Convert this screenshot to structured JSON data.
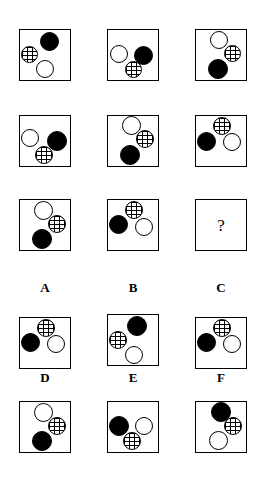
{
  "puzzle": {
    "title": "Visual analogy matrix puzzle",
    "question_mark": "?",
    "circle_kinds": {
      "black": "solid-black-circle",
      "white": "outlined-white-circle",
      "hatch": "cross-hatched-circle"
    },
    "matrix": {
      "rows": 3,
      "cols": 3,
      "cells": [
        {
          "id": "matrix-cell-1-1",
          "box": {
            "x": 19,
            "y": 29,
            "w": 52,
            "h": 52
          },
          "circles": [
            {
              "kind": "black",
              "x": 20,
              "y": 2,
              "d": 19
            },
            {
              "kind": "hatch",
              "x": 1,
              "y": 16,
              "d": 17
            },
            {
              "kind": "white",
              "x": 16,
              "y": 30,
              "d": 18
            }
          ]
        },
        {
          "id": "matrix-cell-1-2",
          "box": {
            "x": 107,
            "y": 29,
            "w": 52,
            "h": 52
          },
          "circles": [
            {
              "kind": "white",
              "x": 2,
              "y": 15,
              "d": 18
            },
            {
              "kind": "black",
              "x": 26,
              "y": 16,
              "d": 19
            },
            {
              "kind": "hatch",
              "x": 17,
              "y": 31,
              "d": 17
            }
          ]
        },
        {
          "id": "matrix-cell-1-3",
          "box": {
            "x": 195,
            "y": 29,
            "w": 52,
            "h": 52
          },
          "circles": [
            {
              "kind": "white",
              "x": 14,
              "y": 1,
              "d": 18
            },
            {
              "kind": "hatch",
              "x": 28,
              "y": 15,
              "d": 17
            },
            {
              "kind": "black",
              "x": 12,
              "y": 29,
              "d": 20
            }
          ]
        },
        {
          "id": "matrix-cell-2-1",
          "box": {
            "x": 19,
            "y": 115,
            "w": 52,
            "h": 52
          },
          "circles": [
            {
              "kind": "white",
              "x": 1,
              "y": 13,
              "d": 18
            },
            {
              "kind": "black",
              "x": 27,
              "y": 15,
              "d": 20
            },
            {
              "kind": "hatch",
              "x": 15,
              "y": 30,
              "d": 18
            }
          ]
        },
        {
          "id": "matrix-cell-2-2",
          "box": {
            "x": 107,
            "y": 115,
            "w": 52,
            "h": 52
          },
          "circles": [
            {
              "kind": "white",
              "x": 14,
              "y": 0,
              "d": 19
            },
            {
              "kind": "hatch",
              "x": 28,
              "y": 14,
              "d": 18
            },
            {
              "kind": "black",
              "x": 12,
              "y": 29,
              "d": 20
            }
          ]
        },
        {
          "id": "matrix-cell-2-3",
          "box": {
            "x": 195,
            "y": 115,
            "w": 52,
            "h": 52
          },
          "circles": [
            {
              "kind": "hatch",
              "x": 17,
              "y": 1,
              "d": 18
            },
            {
              "kind": "black",
              "x": 1,
              "y": 16,
              "d": 19
            },
            {
              "kind": "white",
              "x": 27,
              "y": 17,
              "d": 18
            }
          ]
        },
        {
          "id": "matrix-cell-3-1",
          "box": {
            "x": 19,
            "y": 199,
            "w": 52,
            "h": 52
          },
          "circles": [
            {
              "kind": "white",
              "x": 14,
              "y": 1,
              "d": 19
            },
            {
              "kind": "hatch",
              "x": 28,
              "y": 15,
              "d": 18
            },
            {
              "kind": "black",
              "x": 12,
              "y": 29,
              "d": 20
            }
          ]
        },
        {
          "id": "matrix-cell-3-2",
          "box": {
            "x": 107,
            "y": 199,
            "w": 52,
            "h": 52
          },
          "circles": [
            {
              "kind": "hatch",
              "x": 17,
              "y": 1,
              "d": 18
            },
            {
              "kind": "black",
              "x": 1,
              "y": 15,
              "d": 19
            },
            {
              "kind": "white",
              "x": 27,
              "y": 18,
              "d": 18
            }
          ]
        },
        {
          "id": "matrix-cell-3-3",
          "box": {
            "x": 195,
            "y": 199,
            "w": 52,
            "h": 52
          },
          "circles": [],
          "is_question": true
        }
      ]
    },
    "options": [
      {
        "id": "option-a",
        "label": "A",
        "label_pos": {
          "x": 16,
          "y": 281
        },
        "box": {
          "x": 19,
          "y": 317,
          "w": 52,
          "h": 52
        },
        "circles": [
          {
            "kind": "hatch",
            "x": 17,
            "y": 1,
            "d": 18
          },
          {
            "kind": "black",
            "x": 1,
            "y": 15,
            "d": 19
          },
          {
            "kind": "white",
            "x": 27,
            "y": 17,
            "d": 18
          }
        ]
      },
      {
        "id": "option-b",
        "label": "B",
        "label_pos": {
          "x": 104,
          "y": 281
        },
        "box": {
          "x": 107,
          "y": 314,
          "w": 52,
          "h": 52
        },
        "circles": [
          {
            "kind": "black",
            "x": 19,
            "y": 1,
            "d": 20
          },
          {
            "kind": "hatch",
            "x": 1,
            "y": 16,
            "d": 18
          },
          {
            "kind": "white",
            "x": 17,
            "y": 31,
            "d": 18
          }
        ]
      },
      {
        "id": "option-c",
        "label": "C",
        "label_pos": {
          "x": 192,
          "y": 281
        },
        "box": {
          "x": 195,
          "y": 317,
          "w": 52,
          "h": 52
        },
        "circles": [
          {
            "kind": "hatch",
            "x": 17,
            "y": 1,
            "d": 18
          },
          {
            "kind": "black",
            "x": 1,
            "y": 15,
            "d": 19
          },
          {
            "kind": "white",
            "x": 27,
            "y": 17,
            "d": 18
          }
        ]
      },
      {
        "id": "option-d",
        "label": "D",
        "label_pos": {
          "x": 16,
          "y": 371
        },
        "box": {
          "x": 19,
          "y": 401,
          "w": 52,
          "h": 52
        },
        "circles": [
          {
            "kind": "white",
            "x": 14,
            "y": 1,
            "d": 19
          },
          {
            "kind": "hatch",
            "x": 28,
            "y": 15,
            "d": 18
          },
          {
            "kind": "black",
            "x": 12,
            "y": 29,
            "d": 20
          }
        ]
      },
      {
        "id": "option-e",
        "label": "E",
        "label_pos": {
          "x": 104,
          "y": 371
        },
        "box": {
          "x": 107,
          "y": 401,
          "w": 52,
          "h": 52
        },
        "circles": [
          {
            "kind": "black",
            "x": 1,
            "y": 14,
            "d": 20
          },
          {
            "kind": "white",
            "x": 27,
            "y": 15,
            "d": 18
          },
          {
            "kind": "hatch",
            "x": 15,
            "y": 30,
            "d": 18
          }
        ]
      },
      {
        "id": "option-f",
        "label": "F",
        "label_pos": {
          "x": 192,
          "y": 371
        },
        "box": {
          "x": 195,
          "y": 401,
          "w": 52,
          "h": 52
        },
        "circles": [
          {
            "kind": "black",
            "x": 15,
            "y": 0,
            "d": 20
          },
          {
            "kind": "hatch",
            "x": 28,
            "y": 15,
            "d": 18
          },
          {
            "kind": "white",
            "x": 13,
            "y": 29,
            "d": 19
          }
        ]
      }
    ]
  }
}
